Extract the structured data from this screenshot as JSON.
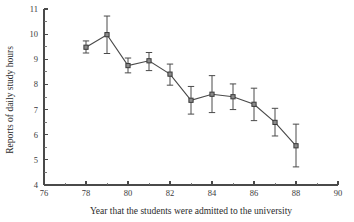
{
  "chart_data": {
    "type": "line",
    "title": "",
    "subtitle": "",
    "xlabel": "Year that the students were admitted to the university",
    "ylabel": "Reports of daily study hours",
    "xlim": [
      76,
      90
    ],
    "ylim": [
      4,
      11
    ],
    "grid": false,
    "legend": "none",
    "x_ticks": [
      76,
      78,
      80,
      82,
      84,
      86,
      88,
      90
    ],
    "x_tick_labels": [
      "76",
      "78",
      "80",
      "82",
      "84",
      "86",
      "88",
      "90"
    ],
    "x_minor_step": 1,
    "y_ticks": [
      4,
      5,
      6,
      7,
      8,
      9,
      10,
      11
    ],
    "y_tick_labels": [
      "4",
      "5",
      "6",
      "7",
      "8",
      "9",
      "10",
      "11"
    ],
    "y_minor_step": 0.5,
    "x": [
      78,
      79,
      80,
      81,
      82,
      83,
      84,
      85,
      86,
      87,
      88
    ],
    "values": [
      9.48,
      9.98,
      8.75,
      8.94,
      8.41,
      7.37,
      7.61,
      7.51,
      7.21,
      6.49,
      5.56
    ],
    "error_low": [
      9.25,
      9.23,
      8.46,
      8.55,
      7.97,
      6.82,
      6.88,
      7.0,
      6.56,
      5.95,
      4.72
    ],
    "error_high": [
      9.73,
      10.72,
      9.05,
      9.27,
      8.81,
      7.92,
      8.35,
      8.02,
      7.85,
      7.05,
      6.42
    ],
    "series": [
      {
        "name": "Reports of daily study hours",
        "values": [
          9.48,
          9.98,
          8.75,
          8.94,
          8.41,
          7.37,
          7.61,
          7.51,
          7.21,
          6.49,
          5.56
        ]
      }
    ],
    "marker": "square",
    "marker_color": "#8a8a8a",
    "line_color": "#4a4a4a",
    "error_bar_color": "#4a4a4a",
    "annotations": []
  }
}
